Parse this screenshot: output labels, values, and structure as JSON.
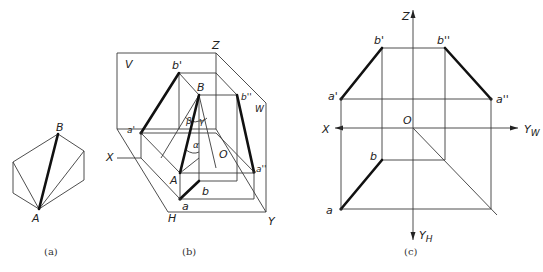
{
  "figure": {
    "panels": [
      {
        "id": "a",
        "caption": "(a)",
        "labels": {
          "B": "B",
          "A": "A"
        },
        "description": "Hexagonal prism outline with diagonal AB emphasized"
      },
      {
        "id": "b",
        "caption": "(b)",
        "labels": {
          "V": "V",
          "H": "H",
          "W": "W",
          "X": "X",
          "Y": "Y",
          "Z": "Z",
          "O": "O",
          "A": "A",
          "B": "B",
          "a": "a",
          "b": "b",
          "a_prime": "a'",
          "b_prime": "b'",
          "a_dprime": "a''",
          "b_dprime": "b''",
          "alpha": "α",
          "beta": "β",
          "gamma": "γ"
        },
        "description": "Three-plane projection system (V, H, W) showing line AB and its projections"
      },
      {
        "id": "c",
        "caption": "(c)",
        "labels": {
          "Z": "Z",
          "X": "X",
          "O": "O",
          "Y_W": "Y",
          "Y_W_sub": "W",
          "Y_H": "Y",
          "Y_H_sub": "H",
          "a": "a",
          "b": "b",
          "a_prime": "a'",
          "b_prime": "b'",
          "a_dprime": "a''",
          "b_dprime": "b''"
        },
        "description": "Orthographic three-view projection drawing of line AB"
      }
    ]
  }
}
